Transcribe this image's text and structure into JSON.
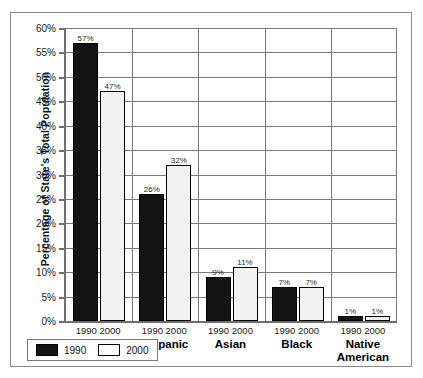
{
  "chart_data": {
    "type": "bar",
    "title": "",
    "xlabel": "",
    "ylabel": "Percentage of State's Total Population",
    "ylim": [
      0,
      60
    ],
    "ytick_step": 5,
    "grid": true,
    "legend_position": "bottom-left",
    "categories": [
      "White",
      "Hispanic",
      "Asian",
      "Black",
      "Native American"
    ],
    "series": [
      {
        "name": "1990",
        "color": "#141414",
        "values": [
          57,
          26,
          9,
          7,
          1
        ]
      },
      {
        "name": "2000",
        "color": "#ffffff",
        "values": [
          47,
          32,
          11,
          7,
          1
        ]
      }
    ],
    "ytick_labels": [
      "60%",
      "55%",
      "50%",
      "45%",
      "40%",
      "35%",
      "30%",
      "25%",
      "20%",
      "15%",
      "10%",
      "5%",
      "0%"
    ],
    "data_labels": [
      [
        "57%",
        "47%"
      ],
      [
        "26%",
        "32%"
      ],
      [
        "9%",
        "11%"
      ],
      [
        "7%",
        "7%"
      ],
      [
        "1%",
        "1%"
      ]
    ],
    "group_year_labels": [
      "1990",
      "2000"
    ]
  },
  "axis": {
    "y_title": "Percentage of State's Total Population",
    "ticks": [
      {
        "label": "60%",
        "value": 60
      },
      {
        "label": "55%",
        "value": 55
      },
      {
        "label": "50%",
        "value": 50
      },
      {
        "label": "45%",
        "value": 45
      },
      {
        "label": "40%",
        "value": 40
      },
      {
        "label": "35%",
        "value": 35
      },
      {
        "label": "30%",
        "value": 30
      },
      {
        "label": "25%",
        "value": 25
      },
      {
        "label": "20%",
        "value": 20
      },
      {
        "label": "15%",
        "value": 15
      },
      {
        "label": "10%",
        "value": 10
      },
      {
        "label": "5%",
        "value": 5
      },
      {
        "label": "0%",
        "value": 0
      }
    ]
  },
  "groups": [
    {
      "category": "White",
      "years_label": "1990 2000",
      "bars": [
        {
          "series": "1990",
          "value": 57,
          "label": "57%"
        },
        {
          "series": "2000",
          "value": 47,
          "label": "47%"
        }
      ]
    },
    {
      "category": "Hispanic",
      "years_label": "1990 2000",
      "bars": [
        {
          "series": "1990",
          "value": 26,
          "label": "26%"
        },
        {
          "series": "2000",
          "value": 32,
          "label": "32%"
        }
      ]
    },
    {
      "category": "Asian",
      "years_label": "1990 2000",
      "bars": [
        {
          "series": "1990",
          "value": 9,
          "label": "9%"
        },
        {
          "series": "2000",
          "value": 11,
          "label": "11%"
        }
      ]
    },
    {
      "category": "Black",
      "years_label": "1990 2000",
      "bars": [
        {
          "series": "1990",
          "value": 7,
          "label": "7%"
        },
        {
          "series": "2000",
          "value": 7,
          "label": "7%"
        }
      ]
    },
    {
      "category": "Native\nAmerican",
      "years_label": "1990 2000",
      "bars": [
        {
          "series": "1990",
          "value": 1,
          "label": "1%"
        },
        {
          "series": "2000",
          "value": 1,
          "label": "1%"
        }
      ]
    }
  ],
  "legend": {
    "items": [
      {
        "label": "1990",
        "color": "#141414"
      },
      {
        "label": "2000",
        "color": "#ffffff"
      }
    ]
  }
}
